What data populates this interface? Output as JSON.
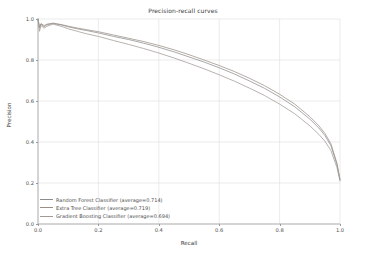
{
  "chart_data": {
    "type": "line",
    "title": "Precision-recall curves",
    "xlabel": "Recall",
    "ylabel": "Precision",
    "xlim": [
      0.0,
      1.0
    ],
    "ylim": [
      0.0,
      1.0
    ],
    "grid": true,
    "legend_position": "lower left",
    "xticks": [
      "0.0",
      "0.2",
      "0.4",
      "0.6",
      "0.8",
      "1.0"
    ],
    "xtick_values": [
      0.0,
      0.2,
      0.4,
      0.6,
      0.8,
      1.0
    ],
    "yticks": [
      "0.0",
      "0.2",
      "0.4",
      "0.6",
      "0.8",
      "1.0"
    ],
    "ytick_values": [
      0.0,
      0.2,
      0.4,
      0.6,
      0.8,
      1.0
    ],
    "x": [
      0.0,
      0.005,
      0.01,
      0.02,
      0.03,
      0.05,
      0.08,
      0.1,
      0.13,
      0.16,
      0.2,
      0.25,
      0.3,
      0.35,
      0.4,
      0.45,
      0.5,
      0.55,
      0.6,
      0.65,
      0.7,
      0.75,
      0.8,
      0.85,
      0.9,
      0.93,
      0.95,
      0.97,
      0.99,
      1.0
    ],
    "series": [
      {
        "name": "Random Forest Classifier",
        "label": "Random Forest Classifier  (average=0.714)",
        "average": 0.714,
        "color": "#8c8c8c",
        "values": [
          1.0,
          0.955,
          0.975,
          0.962,
          0.972,
          0.978,
          0.97,
          0.962,
          0.952,
          0.944,
          0.932,
          0.915,
          0.9,
          0.882,
          0.862,
          0.84,
          0.815,
          0.79,
          0.762,
          0.732,
          0.698,
          0.662,
          0.62,
          0.572,
          0.512,
          0.468,
          0.432,
          0.382,
          0.29,
          0.215
        ]
      },
      {
        "name": "Extra Tree Classifier",
        "label": "Extra Tree Classifier  (average=0.719)",
        "average": 0.719,
        "color": "#9a8f86",
        "values": [
          1.0,
          0.962,
          0.978,
          0.968,
          0.975,
          0.98,
          0.972,
          0.965,
          0.956,
          0.948,
          0.938,
          0.922,
          0.906,
          0.89,
          0.871,
          0.85,
          0.826,
          0.8,
          0.773,
          0.744,
          0.711,
          0.675,
          0.633,
          0.585,
          0.524,
          0.479,
          0.442,
          0.391,
          0.296,
          0.218
        ]
      },
      {
        "name": "Gradient Boosting Classifier",
        "label": "Gradient Boosting Classifier  (average=0.694)",
        "average": 0.694,
        "color": "#a09a94",
        "values": [
          1.0,
          0.94,
          0.968,
          0.955,
          0.965,
          0.975,
          0.963,
          0.952,
          0.94,
          0.928,
          0.915,
          0.895,
          0.876,
          0.856,
          0.834,
          0.81,
          0.784,
          0.757,
          0.728,
          0.697,
          0.663,
          0.627,
          0.585,
          0.538,
          0.479,
          0.437,
          0.404,
          0.358,
          0.276,
          0.21
        ]
      }
    ]
  }
}
